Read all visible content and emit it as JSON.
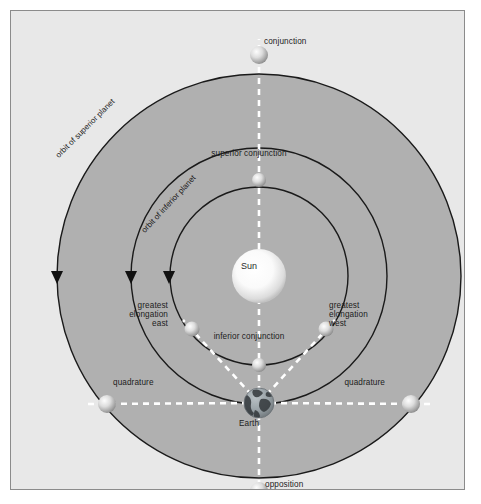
{
  "figure": {
    "width": 481,
    "height": 504
  },
  "colors": {
    "background": "#ffffff",
    "panel_fill": "#e8e8e8",
    "panel_border": "#8b8b8b",
    "orbit_disc_fill": "#b0b0b0",
    "orbit_stroke": "#1a1a1a",
    "sightline_dash": "#ffffff",
    "label_text": "#1c1c1c",
    "sun_core": "#ffffff",
    "sun_edge": "#c9c9c9",
    "planet_core": "#f2f2f2",
    "planet_edge": "#8e8e8e",
    "earth_ocean": "#9aa3a8",
    "earth_land": "#3a3f42"
  },
  "center": {
    "label": "Sun",
    "x": 238,
    "y": 255,
    "radius": 27
  },
  "orbits": [
    {
      "name": "orbit-inferior-inner",
      "radius": 89,
      "label": "",
      "arrow": true
    },
    {
      "name": "orbit-inferior-planet",
      "radius": 128,
      "label": "orbit of inferior planet",
      "arrow": true
    },
    {
      "name": "orbit-superior-planet",
      "radius": 202,
      "label": "orbit of superior planet",
      "arrow": true
    }
  ],
  "orbit_labels": {
    "superior": "orbit of superior planet",
    "inferior": "orbit of inferior planet"
  },
  "bodies": [
    {
      "name": "earth",
      "label": "Earth",
      "x": 238,
      "y": 382,
      "radius": 15,
      "kind": "earth",
      "label_x": 238,
      "label_y": 413,
      "label_align": "ctr"
    },
    {
      "name": "conjunction",
      "label": "conjunction",
      "x": 238,
      "y": 34,
      "radius": 9,
      "kind": "planet",
      "label_x": 253,
      "label_y": 31,
      "label_align": "lft"
    },
    {
      "name": "superior-conjunction",
      "label": "superior conjunction",
      "x": 238,
      "y": 159,
      "radius": 7,
      "kind": "planet",
      "label_x": 238,
      "label_y": 143,
      "label_align": "ctr"
    },
    {
      "name": "inferior-conjunction",
      "label": "inferior conjunction",
      "x": 238,
      "y": 344,
      "radius": 7,
      "kind": "planet",
      "label_x": 238,
      "label_y": 326,
      "label_align": "ctr"
    },
    {
      "name": "greatest-elongation-east",
      "label": "greatest\nelongation\neast",
      "x": 171,
      "y": 308,
      "radius": 7,
      "kind": "planet",
      "label_x": 157,
      "label_y": 304,
      "label_align": "rgt"
    },
    {
      "name": "greatest-elongation-west",
      "label": "greatest\nelongation\nwest",
      "x": 305,
      "y": 308,
      "radius": 7,
      "kind": "planet",
      "label_x": 318,
      "label_y": 304,
      "label_align": "lft"
    },
    {
      "name": "quadrature-east",
      "label": "quadrature",
      "x": 86,
      "y": 383,
      "radius": 9,
      "kind": "planet",
      "label_x": 102,
      "label_y": 372,
      "label_align": "lft"
    },
    {
      "name": "quadrature-west",
      "label": "quadrature",
      "x": 390,
      "y": 383,
      "radius": 9,
      "kind": "planet",
      "label_x": 374,
      "label_y": 372,
      "label_align": "rgt"
    },
    {
      "name": "opposition",
      "label": "opposition",
      "x": 238,
      "y": 470,
      "radius": 9,
      "kind": "planet",
      "label_x": 254,
      "label_y": 474,
      "label_align": "lft"
    }
  ],
  "sightlines": [
    {
      "name": "earth-to-conjunction",
      "from": [
        238,
        382
      ],
      "to": [
        238,
        20
      ]
    },
    {
      "name": "earth-to-quadrature-east",
      "from": [
        238,
        382
      ],
      "to": [
        70,
        383
      ]
    },
    {
      "name": "earth-to-quadrature-west",
      "from": [
        238,
        382
      ],
      "to": [
        406,
        383
      ]
    },
    {
      "name": "earth-to-greatest-elongation-east",
      "from": [
        238,
        382
      ],
      "to": [
        164,
        301
      ]
    },
    {
      "name": "earth-to-greatest-elongation-west",
      "from": [
        238,
        382
      ],
      "to": [
        312,
        301
      ]
    },
    {
      "name": "earth-to-opposition",
      "from": [
        238,
        382
      ],
      "to": [
        238,
        482
      ]
    }
  ],
  "arrows": [
    {
      "name": "arrow-orbit-superior",
      "x": 36,
      "y": 256
    },
    {
      "name": "arrow-orbit-inferior",
      "x": 110,
      "y": 256
    },
    {
      "name": "arrow-orbit-inner",
      "x": 148,
      "y": 256
    }
  ]
}
